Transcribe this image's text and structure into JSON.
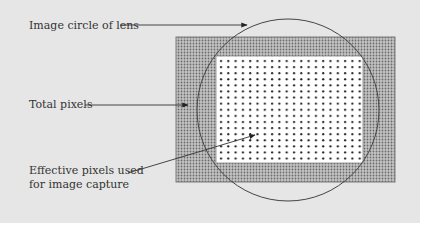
{
  "diagram": {
    "labels": {
      "image_circle": "Image circle of lens",
      "total_pixels": "Total pixels",
      "effective_line1": "Effective pixels used",
      "effective_line2": "for  image capture"
    },
    "colors": {
      "background": "#e6e6e6",
      "sensor_fill": "#b8b8b8",
      "effective_fill": "#ffffff",
      "stroke": "#444444"
    }
  }
}
